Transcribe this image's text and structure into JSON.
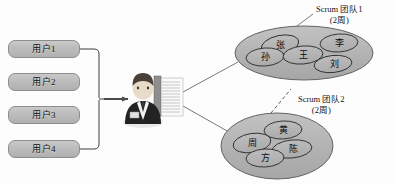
{
  "diagram": {
    "users": [
      {
        "id": "user-1",
        "label": "用户1"
      },
      {
        "id": "user-2",
        "label": "用户2"
      },
      {
        "id": "user-3",
        "label": "用户3"
      },
      {
        "id": "user-4",
        "label": "用户4"
      }
    ],
    "actor": {
      "name": "product-owner-figure",
      "description": "businessman"
    },
    "artifact": {
      "name": "backlog-document",
      "description": "document with text lines"
    },
    "teams": [
      {
        "id": "scrum-team-1",
        "label": "Scrum 团队1",
        "sprint": "(2周)",
        "members": [
          {
            "id": "member-zhang",
            "name": "张"
          },
          {
            "id": "member-li",
            "name": "李"
          },
          {
            "id": "member-sun",
            "name": "孙"
          },
          {
            "id": "member-wang",
            "name": "王"
          },
          {
            "id": "member-liu",
            "name": "刘"
          }
        ]
      },
      {
        "id": "scrum-team-2",
        "label": "Scrum 团队2",
        "sprint": "(2周)",
        "members": [
          {
            "id": "member-huang",
            "name": "黄"
          },
          {
            "id": "member-zhou",
            "name": "周"
          },
          {
            "id": "member-fang",
            "name": "方"
          },
          {
            "id": "member-chen",
            "name": "陈"
          }
        ]
      }
    ],
    "colors": {
      "box_fill": "#bdbdbd",
      "box_stroke": "#8d8d8d",
      "ellipse_fill": "#b3b3b3",
      "ellipse_stroke": "#5e5e5e",
      "member_stroke": "#2e2e2e",
      "connector": "#4a4a4a",
      "text": "#111111",
      "background": "#fdfdfd"
    }
  }
}
